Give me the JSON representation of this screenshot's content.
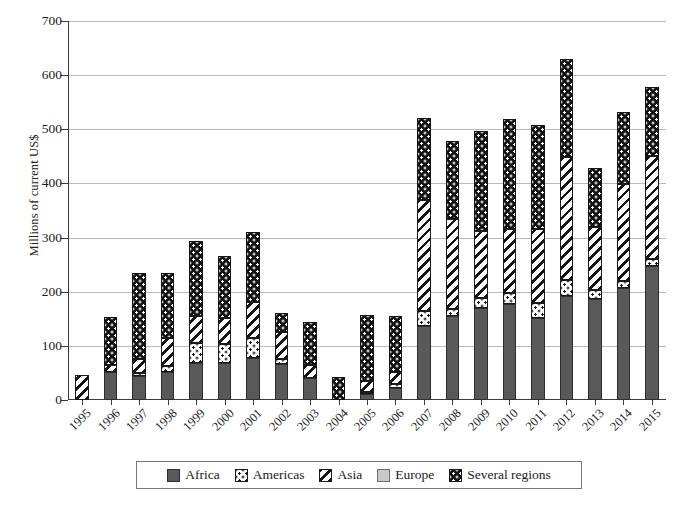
{
  "chart_data": {
    "type": "bar",
    "subtype": "stacked-vertical",
    "title": "",
    "xlabel": "",
    "ylabel": "Millions of current US$",
    "ylim": [
      0,
      700
    ],
    "y_ticks": [
      0,
      100,
      200,
      300,
      400,
      500,
      600,
      700
    ],
    "grid": "horizontal",
    "legend_position": "bottom",
    "categories": [
      "1995",
      "1996",
      "1997",
      "1998",
      "1999",
      "2000",
      "2001",
      "2002",
      "2003",
      "2004",
      "2005",
      "2006",
      "2007",
      "2008",
      "2009",
      "2010",
      "2011",
      "2012",
      "2013",
      "2014",
      "2015"
    ],
    "series": [
      {
        "name": "Africa",
        "color": "#595959",
        "pattern": "solid-dark-gray",
        "values": [
          0,
          52,
          45,
          52,
          68,
          68,
          78,
          66,
          40,
          0,
          12,
          23,
          137,
          155,
          170,
          178,
          152,
          193,
          187,
          207,
          247
        ]
      },
      {
        "name": "Americas",
        "color": "#ffffff",
        "pattern": "white-with-black-dots",
        "values": [
          0,
          0,
          4,
          11,
          37,
          36,
          36,
          10,
          0,
          0,
          3,
          6,
          28,
          13,
          18,
          19,
          28,
          29,
          17,
          12,
          14
        ]
      },
      {
        "name": "Asia",
        "color": "#ffffff",
        "pattern": "diagonal-stripes",
        "values": [
          46,
          13,
          26,
          51,
          50,
          47,
          67,
          50,
          25,
          0,
          19,
          22,
          204,
          167,
          125,
          118,
          135,
          227,
          115,
          180,
          189
        ]
      },
      {
        "name": "Europe",
        "color": "#c9c9c9",
        "pattern": "solid-light-gray",
        "values": [
          0,
          0,
          0,
          0,
          0,
          0,
          0,
          0,
          0,
          0,
          0,
          0,
          0,
          0,
          0,
          0,
          0,
          0,
          0,
          0,
          0
        ]
      },
      {
        "name": "Several regions",
        "color": "#141414",
        "pattern": "black-with-white-dots",
        "values": [
          0,
          88,
          160,
          121,
          139,
          115,
          130,
          34,
          80,
          43,
          122,
          105,
          151,
          144,
          183,
          205,
          193,
          180,
          110,
          133,
          128
        ]
      }
    ],
    "totals": [
      46,
      153,
      235,
      235,
      294,
      266,
      311,
      160,
      145,
      43,
      156,
      156,
      520,
      479,
      496,
      520,
      508,
      629,
      429,
      532,
      578
    ]
  },
  "legend": {
    "items": [
      {
        "label": "Africa",
        "key": "africa"
      },
      {
        "label": "Americas",
        "key": "americas"
      },
      {
        "label": "Asia",
        "key": "asia"
      },
      {
        "label": "Europe",
        "key": "europe"
      },
      {
        "label": "Several regions",
        "key": "several"
      }
    ]
  }
}
